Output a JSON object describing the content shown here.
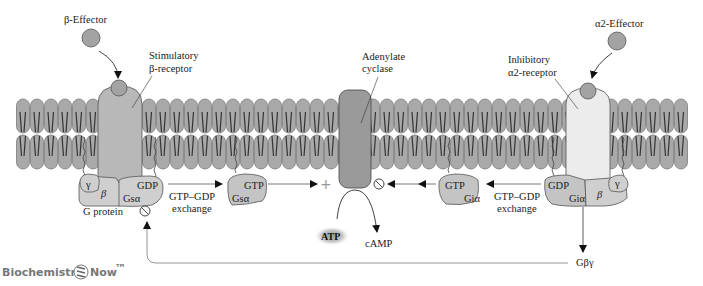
{
  "colors": {
    "lipid_head": "#a9a9a9",
    "lipid_outline": "#6e6e6e",
    "receptor_stim": "#b8b8b8",
    "receptor_inhib": "#ececec",
    "adenylate_cyclase": "#9a9a9a",
    "g_protein": "#cfcfcf",
    "g_alpha_active": "#c4c4c4",
    "effector": "#a3a3a3",
    "arrow": "#111111",
    "feedback_line": "#888888",
    "logo": "#7a7a7a"
  },
  "labels": {
    "beta_effector": "β-Effector",
    "alpha2_effector": "α2-Effector",
    "stim_receptor_line1": "Stimulatory",
    "stim_receptor_line2": "β-receptor",
    "inhib_receptor_line1": "Inhibitory",
    "inhib_receptor_line2": "α2-receptor",
    "adenylate_line1": "Adenylate",
    "adenylate_line2": "cyclase",
    "g_protein": "G protein",
    "exchange_left_line1": "GTP–GDP",
    "exchange_left_line2": "exchange",
    "exchange_right_line1": "GTP–GDP",
    "exchange_right_line2": "exchange",
    "atp": "ATP",
    "camp": "cAMP",
    "g_beta_gamma": "Gβγ",
    "plus_sign": "+"
  },
  "left_g_protein": {
    "gamma": "γ",
    "beta": "β",
    "gdp": "GDP",
    "g_alpha": "Gsα"
  },
  "left_active": {
    "gtp": "GTP",
    "g_alpha": "Gsα"
  },
  "right_g_protein": {
    "gamma": "γ",
    "beta": "β",
    "gdp": "GDP",
    "g_alpha": "Giα"
  },
  "right_active": {
    "gtp": "GTP",
    "g_alpha": "Giα"
  },
  "logo": {
    "left": "Biochemistry",
    "right": "Now",
    "tm": "™"
  }
}
